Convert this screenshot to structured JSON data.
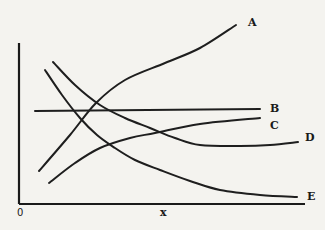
{
  "chart_data": {
    "type": "line",
    "title": "",
    "xlabel": "x",
    "ylabel": "",
    "origin_label": "0",
    "grid": false,
    "legend": "inline labels at curve ends",
    "axis_color": "#1a1a1a",
    "line_color": "#1e1e1e",
    "series": [
      {
        "name": "A",
        "shape": "increasing, concave",
        "points": [
          [
            39,
            171
          ],
          [
            70,
            135
          ],
          [
            96,
            103
          ],
          [
            125,
            80
          ],
          [
            165,
            63
          ],
          [
            200,
            48
          ],
          [
            236,
            25
          ]
        ],
        "label_pos": [
          248,
          26
        ]
      },
      {
        "name": "B",
        "shape": "horizontal constant",
        "points": [
          [
            35,
            111
          ],
          [
            260,
            109
          ]
        ],
        "label_pos": [
          270,
          112
        ]
      },
      {
        "name": "C",
        "shape": "increasing, levelling off",
        "points": [
          [
            49,
            183
          ],
          [
            75,
            163
          ],
          [
            100,
            148
          ],
          [
            130,
            138
          ],
          [
            155,
            133
          ],
          [
            200,
            124
          ],
          [
            260,
            118
          ]
        ],
        "label_pos": [
          270,
          129
        ]
      },
      {
        "name": "D",
        "shape": "decreasing to minimum then slight rise",
        "points": [
          [
            53,
            62
          ],
          [
            75,
            85
          ],
          [
            100,
            105
          ],
          [
            125,
            118
          ],
          [
            150,
            128
          ],
          [
            175,
            138
          ],
          [
            200,
            145
          ],
          [
            240,
            146
          ],
          [
            270,
            145
          ],
          [
            298,
            142
          ]
        ],
        "label_pos": [
          305,
          141
        ]
      },
      {
        "name": "E",
        "shape": "decreasing, convex",
        "points": [
          [
            45,
            70
          ],
          [
            62,
            95
          ],
          [
            80,
            118
          ],
          [
            97,
            135
          ],
          [
            115,
            148
          ],
          [
            135,
            160
          ],
          [
            160,
            170
          ],
          [
            190,
            181
          ],
          [
            220,
            190
          ],
          [
            260,
            195
          ],
          [
            297,
            197
          ]
        ],
        "label_pos": [
          307,
          200
        ]
      }
    ],
    "axes": {
      "y_axis": {
        "x": 19,
        "y_top": 43,
        "y_bottom": 204
      },
      "x_axis": {
        "y": 204,
        "x_left": 19,
        "x_right": 305
      }
    }
  }
}
